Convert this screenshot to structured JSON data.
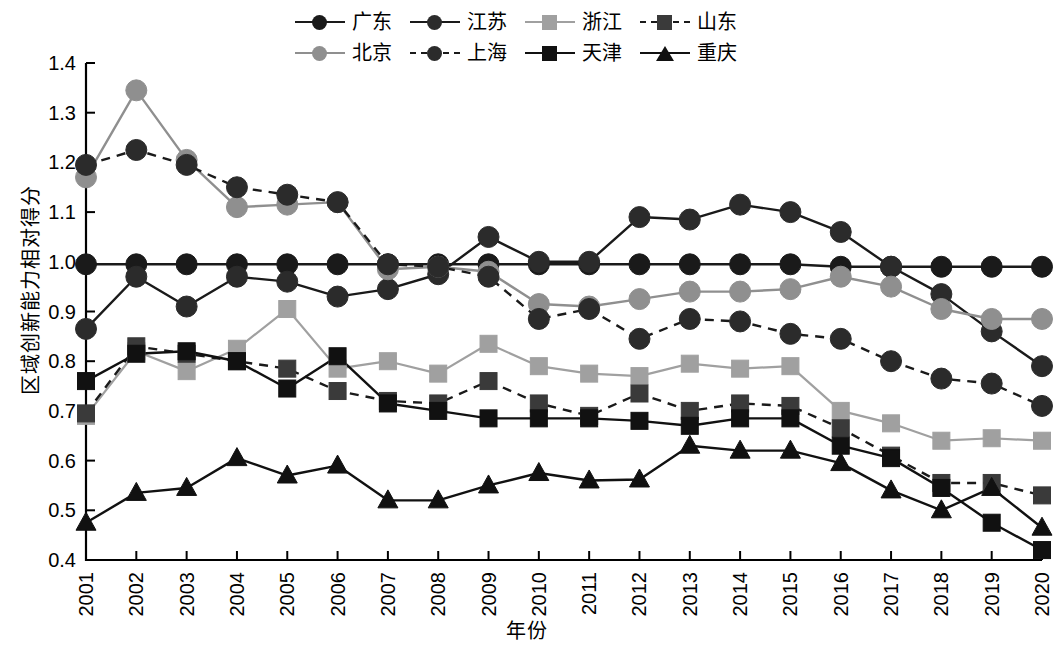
{
  "chart_data": {
    "type": "line",
    "title": "",
    "xlabel": "年份",
    "ylabel": "区域创新能力相对得分",
    "x": [
      "2001",
      "2002",
      "2003",
      "2004",
      "2005",
      "2006",
      "2007",
      "2008",
      "2009",
      "2010",
      "2011",
      "2012",
      "2013",
      "2014",
      "2015",
      "2016",
      "2017",
      "2018",
      "2019",
      "2020"
    ],
    "categories": [
      "2001",
      "2002",
      "2003",
      "2004",
      "2005",
      "2006",
      "2007",
      "2008",
      "2009",
      "2010",
      "2011",
      "2012",
      "2013",
      "2014",
      "2015",
      "2016",
      "2017",
      "2018",
      "2019",
      "2020"
    ],
    "ylim": [
      0.4,
      1.4
    ],
    "xlim": [
      "2001",
      "2020"
    ],
    "ytick_labels": [
      "0.4",
      "0.5",
      "0.6",
      "0.7",
      "0.8",
      "0.9",
      "1.0",
      "1.1",
      "1.2",
      "1.3",
      "1.4"
    ],
    "ytick_values": [
      0.4,
      0.5,
      0.6,
      0.7,
      0.8,
      0.9,
      1.0,
      1.1,
      1.2,
      1.3,
      1.4
    ],
    "grid": false,
    "legend_position": "top",
    "series": [
      {
        "name": "广东",
        "color": "#1a1a1a",
        "line_color": "#1a1a1a",
        "marker": "circle",
        "dash": "solid",
        "values": [
          0.995,
          0.995,
          0.995,
          0.995,
          0.995,
          0.995,
          0.995,
          0.995,
          0.995,
          0.995,
          0.995,
          0.995,
          0.995,
          0.995,
          0.995,
          0.99,
          0.99,
          0.99,
          0.99,
          0.99
        ]
      },
      {
        "name": "江苏",
        "color": "#2b2b2b",
        "line_color": "#1a1a1a",
        "marker": "circle",
        "dash": "solid",
        "values": [
          0.865,
          0.97,
          0.91,
          0.97,
          0.96,
          0.93,
          0.945,
          0.975,
          1.05,
          1.0,
          1.0,
          1.09,
          1.085,
          1.115,
          1.1,
          1.06,
          0.99,
          0.935,
          0.86,
          0.79
        ]
      },
      {
        "name": "浙江",
        "color": "#a0a0a0",
        "line_color": "#a0a0a0",
        "marker": "square",
        "dash": "solid",
        "values": [
          0.69,
          0.82,
          0.78,
          0.825,
          0.905,
          0.785,
          0.8,
          0.775,
          0.835,
          0.79,
          0.775,
          0.77,
          0.795,
          0.785,
          0.79,
          0.7,
          0.675,
          0.64,
          0.645,
          0.64
        ]
      },
      {
        "name": "山东",
        "color": "#3a3a3a",
        "line_color": "#1a1a1a",
        "marker": "square",
        "dash": "dashed",
        "values": [
          0.695,
          0.83,
          0.815,
          0.8,
          0.785,
          0.74,
          0.72,
          0.715,
          0.76,
          0.715,
          0.69,
          0.735,
          0.7,
          0.715,
          0.71,
          0.665,
          0.61,
          0.555,
          0.555,
          0.53
        ]
      },
      {
        "name": "北京",
        "color": "#8f8f8f",
        "line_color": "#8f8f8f",
        "marker": "circle",
        "dash": "solid",
        "values": [
          1.17,
          1.345,
          1.205,
          1.11,
          1.115,
          1.12,
          0.985,
          0.99,
          0.98,
          0.915,
          0.91,
          0.925,
          0.94,
          0.94,
          0.945,
          0.97,
          0.95,
          0.905,
          0.885,
          0.885
        ]
      },
      {
        "name": "上海",
        "color": "#2b2b2b",
        "line_color": "#1a1a1a",
        "marker": "circle",
        "dash": "dashed",
        "values": [
          1.195,
          1.225,
          1.195,
          1.15,
          1.135,
          1.12,
          0.995,
          0.99,
          0.97,
          0.885,
          0.905,
          0.845,
          0.885,
          0.88,
          0.855,
          0.845,
          0.8,
          0.765,
          0.755,
          0.71
        ]
      },
      {
        "name": "天津",
        "color": "#111111",
        "line_color": "#111111",
        "marker": "square",
        "dash": "solid",
        "values": [
          0.76,
          0.815,
          0.82,
          0.8,
          0.745,
          0.81,
          0.715,
          0.7,
          0.685,
          0.685,
          0.685,
          0.68,
          0.67,
          0.685,
          0.685,
          0.63,
          0.605,
          0.545,
          0.475,
          0.42
        ]
      },
      {
        "name": "重庆",
        "color": "#111111",
        "line_color": "#111111",
        "marker": "triangle",
        "dash": "solid",
        "values": [
          0.475,
          0.535,
          0.545,
          0.605,
          0.57,
          0.59,
          0.52,
          0.52,
          0.55,
          0.575,
          0.56,
          0.562,
          0.63,
          0.62,
          0.62,
          0.595,
          0.54,
          0.5,
          0.545,
          0.465
        ]
      }
    ]
  },
  "legend": {
    "rows": [
      [
        {
          "label": "广东",
          "key": 0
        },
        {
          "label": "江苏",
          "key": 1
        },
        {
          "label": "浙江",
          "key": 2
        },
        {
          "label": "山东",
          "key": 3
        }
      ],
      [
        {
          "label": "北京",
          "key": 4
        },
        {
          "label": "上海",
          "key": 5
        },
        {
          "label": "天津",
          "key": 6
        },
        {
          "label": "重庆",
          "key": 7
        }
      ]
    ]
  }
}
